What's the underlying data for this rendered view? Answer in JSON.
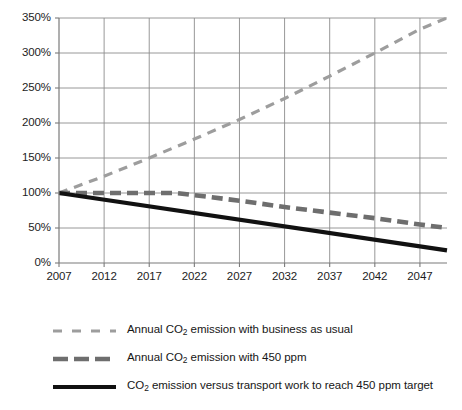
{
  "chart_data": {
    "type": "line",
    "title": "",
    "xlabel": "",
    "ylabel": "",
    "xlim": [
      2007,
      2050
    ],
    "ylim": [
      0,
      350
    ],
    "grid": true,
    "legend_position": "below",
    "x_ticks": [
      "2007",
      "2012",
      "2017",
      "2022",
      "2027",
      "2032",
      "2037",
      "2042",
      "2047"
    ],
    "x_tick_values": [
      2007,
      2012,
      2017,
      2022,
      2027,
      2032,
      2037,
      2042,
      2047
    ],
    "y_ticks": [
      "0%",
      "50%",
      "100%",
      "150%",
      "200%",
      "250%",
      "300%",
      "350%"
    ],
    "y_tick_values": [
      0,
      50,
      100,
      150,
      200,
      250,
      300,
      350
    ],
    "series": [
      {
        "name": "Annual CO2 emission with business as usual",
        "style": "dashed-light",
        "color": "#9d9d9d",
        "width": 3.2,
        "dash": "9,7",
        "x": [
          2007,
          2012,
          2017,
          2022,
          2027,
          2032,
          2037,
          2042,
          2047,
          2050
        ],
        "values": [
          100,
          124,
          150,
          177,
          205,
          235,
          267,
          300,
          334,
          350
        ]
      },
      {
        "name": "Annual CO2 emission with 450 ppm",
        "style": "dashed-heavy",
        "color": "#6e6e6e",
        "width": 4.6,
        "dash": "11,6",
        "x": [
          2007,
          2012,
          2017,
          2020,
          2022,
          2027,
          2032,
          2037,
          2042,
          2047,
          2050
        ],
        "values": [
          100,
          100,
          100,
          100,
          97,
          89,
          80,
          72,
          64,
          55,
          50
        ]
      },
      {
        "name": "CO2 emission versus transport work to reach 450 ppm target",
        "style": "solid",
        "color": "#111111",
        "width": 4.2,
        "dash": "",
        "x": [
          2007,
          2050
        ],
        "values": [
          100,
          18
        ]
      }
    ]
  },
  "legend": {
    "items": [
      {
        "label_pre": "Annual CO",
        "label_sub": "2",
        "label_post": " emission with business as usual",
        "swatch": "dashed-light-swatch"
      },
      {
        "label_pre": "Annual CO",
        "label_sub": "2",
        "label_post": " emission with 450 ppm",
        "swatch": "dashed-heavy-swatch"
      },
      {
        "label_pre": "CO",
        "label_sub": "2",
        "label_post": " emission versus transport work to reach 450 ppm target",
        "swatch": "solid-swatch"
      }
    ]
  },
  "caption": {
    "text": ""
  },
  "colors": {
    "bau": "#9d9d9d",
    "ppm450": "#6e6e6e",
    "target": "#111111",
    "grid": "#8c8c8c",
    "axis": "#7a7a7a",
    "text": "#1a1a1a"
  }
}
